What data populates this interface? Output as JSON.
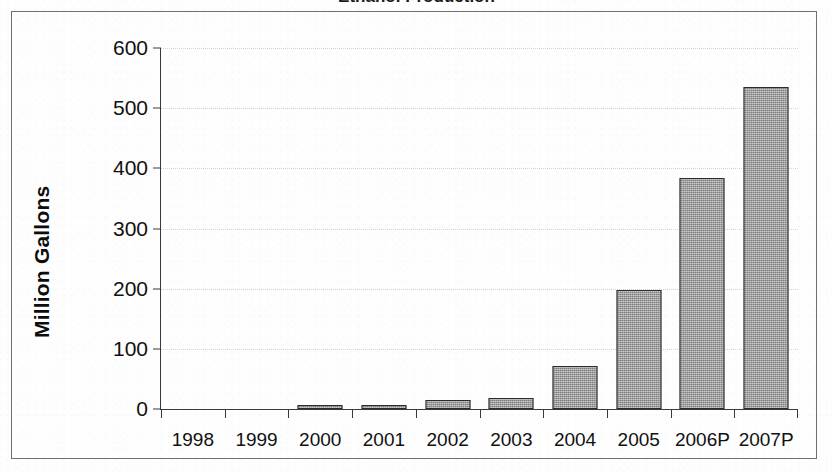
{
  "document": {
    "title_fragment": "Ethanol Production",
    "frame_visible": true
  },
  "chart_data": {
    "type": "bar",
    "title": "Ethanol Production",
    "subtitle": "",
    "xlabel": "",
    "ylabel": "Million Gallons",
    "categories": [
      "1998",
      "1999",
      "2000",
      "2001",
      "2002",
      "2003",
      "2004",
      "2005",
      "2006P",
      "2007P"
    ],
    "values": [
      0,
      0,
      6,
      6,
      15,
      18,
      71,
      198,
      384,
      535
    ],
    "ylim": [
      0,
      600
    ],
    "ytick_values": [
      0,
      100,
      200,
      300,
      400,
      500,
      600
    ],
    "ytick_labels": [
      "0",
      "100",
      "200",
      "300",
      "400",
      "500",
      "600"
    ],
    "grid": true,
    "grid_axis": "y",
    "legend": null,
    "legend_position": "none",
    "bar_fill_color": "#9a9a9a",
    "bar_border_color": "#2b2b2b",
    "axis_color": "#3a3a3a",
    "gridline_color": "#d3d3d3",
    "background_color": "#ffffff"
  }
}
